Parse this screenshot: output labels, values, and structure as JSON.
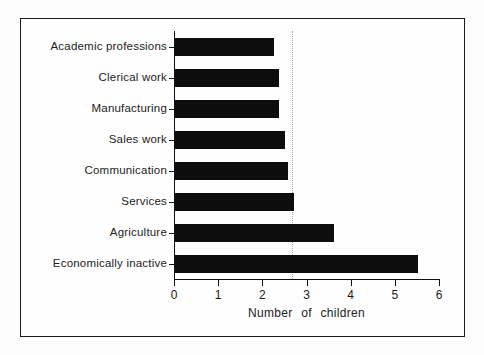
{
  "figure": {
    "background": "#fdfdfd",
    "frame_border_color": "#1a1a1a"
  },
  "chart_data": {
    "type": "bar",
    "orientation": "horizontal",
    "title": "",
    "xlabel": "Number of children",
    "ylabel": "",
    "categories": [
      "Academic professions",
      "Clerical work",
      "Manufacturing",
      "Sales work",
      "Communication",
      "Services",
      "Agriculture",
      "Economically inactive"
    ],
    "values": [
      2.25,
      2.35,
      2.35,
      2.5,
      2.55,
      2.7,
      3.6,
      5.5
    ],
    "xlim": [
      0,
      6
    ],
    "xticks": [
      0,
      1,
      2,
      3,
      4,
      5,
      6
    ],
    "reference_line_x": 2.65,
    "bar_color": "#0d0d0d",
    "axis_color": "#111111",
    "reference_line_color": "#a8a8a8",
    "grid": false,
    "legend": null
  }
}
